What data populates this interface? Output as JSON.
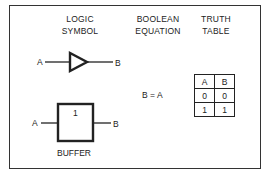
{
  "headers": {
    "logic_symbol": [
      "LOGIC",
      "SYMBOL"
    ],
    "boolean_equation": [
      "BOOLEAN",
      "EQUATION"
    ],
    "truth_table": [
      "TRUTH",
      "TABLE"
    ]
  },
  "triangle_symbol": {
    "input": "A",
    "output": "B"
  },
  "rect_symbol": {
    "input": "A",
    "output": "B",
    "qualifier": "1",
    "caption": "BUFFER"
  },
  "equation": "B = A",
  "truth_table": {
    "columns": [
      "A",
      "B"
    ],
    "rows": [
      [
        "0",
        "0"
      ],
      [
        "1",
        "1"
      ]
    ]
  }
}
